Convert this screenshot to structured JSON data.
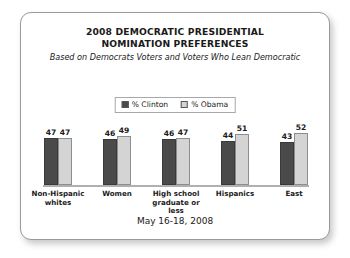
{
  "card": {
    "title_lines": [
      "2008 DEMOCRATIC PRESIDENTIAL",
      "NOMINATION PREFERENCES"
    ],
    "subtitle": "Based on Democrats Voters and Voters Who Lean Democratic",
    "footer": "May 16-18, 2008"
  },
  "legend": {
    "items": [
      {
        "label": "% Clinton",
        "color": "#4a4a4a",
        "swatch": "clinton-swatch"
      },
      {
        "label": "% Obama",
        "color": "#d4d4d4",
        "swatch": "obama-swatch"
      }
    ]
  },
  "chart_data": {
    "type": "bar",
    "title": "2008 DEMOCRATIC PRESIDENTIAL NOMINATION PREFERENCES",
    "subtitle": "Based on Democrats Voters and Voters Who Lean Democratic",
    "annotation": "May 16-18, 2008",
    "categories": [
      "Non-Hispanic whites",
      "Women",
      "High school graduate or less",
      "Hispanics",
      "East"
    ],
    "series": [
      {
        "name": "% Clinton",
        "color": "#4a4a4a",
        "values": [
          47,
          46,
          46,
          44,
          43
        ]
      },
      {
        "name": "% Obama",
        "color": "#d4d4d4",
        "values": [
          47,
          49,
          47,
          51,
          52
        ]
      }
    ],
    "xlabel": "",
    "ylabel": "",
    "ylim": [
      0,
      60
    ],
    "grid": false,
    "legend_position": "top-center",
    "axis": {
      "baseline_visible": true,
      "y_ticks_visible": false
    }
  }
}
